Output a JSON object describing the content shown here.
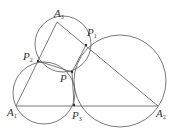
{
  "diagram": {
    "stroke_color": "#555555",
    "points": {
      "A1": {
        "label": "A",
        "sub": "1",
        "x": 16,
        "y": 106
      },
      "A2": {
        "label": "A",
        "sub": "2",
        "x": 158,
        "y": 106
      },
      "A3": {
        "label": "A",
        "sub": "3",
        "x": 57,
        "y": 22
      },
      "P": {
        "label": "P",
        "sub": "",
        "x": 72,
        "y": 72
      },
      "P1": {
        "label": "P",
        "sub": "1",
        "x": 86,
        "y": 45
      },
      "P2": {
        "label": "P",
        "sub": "2",
        "x": 38,
        "y": 61
      },
      "P3": {
        "label": "P",
        "sub": "3",
        "x": 74,
        "y": 105
      }
    },
    "circles": [
      {
        "name": "circle-A3-P2-P-P1",
        "cx": 63,
        "cy": 44,
        "r": 28
      },
      {
        "name": "circle-A1-P2-P-P3",
        "cx": 44,
        "cy": 93,
        "r": 31
      },
      {
        "name": "circle-A2-P1-P-P3",
        "cx": 120,
        "cy": 81,
        "r": 46
      }
    ]
  }
}
